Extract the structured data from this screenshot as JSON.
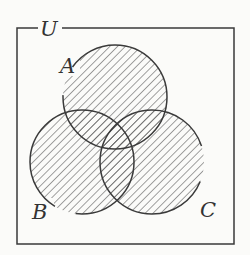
{
  "diagram": {
    "type": "venn",
    "universe_label": "U",
    "sets": [
      {
        "label": "A",
        "cx": 115,
        "cy": 97,
        "r": 52
      },
      {
        "label": "B",
        "cx": 82,
        "cy": 162,
        "r": 52
      },
      {
        "label": "C",
        "cx": 152,
        "cy": 162,
        "r": 52
      }
    ],
    "shaded_regions": "A ∪ B ∪ C",
    "colors": {
      "line": "#3a3a3a",
      "hatch": "#555555",
      "background": "#fbfbf9"
    }
  }
}
